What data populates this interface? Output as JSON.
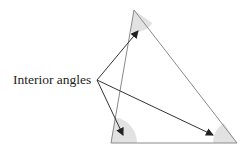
{
  "diagram": {
    "label": "Interior angles",
    "colors": {
      "triangle_stroke": "#8a8a8a",
      "sector_fill": "#e2e2e2",
      "arrow": "#333333",
      "text": "#222222"
    },
    "vertices": {
      "top": [
        134,
        10
      ],
      "bottom_left": [
        111,
        143
      ],
      "bottom_right": [
        237,
        143
      ]
    },
    "arrow_origin": [
      97,
      80
    ],
    "arrow_targets": [
      [
        138,
        31
      ],
      [
        123,
        135
      ],
      [
        213,
        135
      ]
    ]
  }
}
